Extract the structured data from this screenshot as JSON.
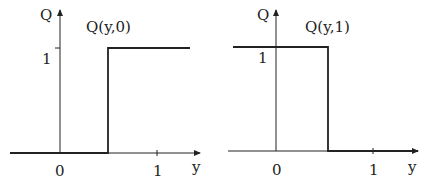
{
  "panels": [
    {
      "id": "left",
      "axis_y_label": "Q",
      "axis_x_label": "y",
      "function_label": "Q(y,0)",
      "tick_x0": "0",
      "tick_x1": "1",
      "tick_y1": "1",
      "description": "Step function: 0 for y < 0.5, 1 for y > 0.5"
    },
    {
      "id": "right",
      "axis_y_label": "Q",
      "axis_x_label": "y",
      "function_label": "Q(y,1)",
      "tick_x0": "0",
      "tick_x1": "1",
      "tick_y1": "1",
      "description": "Step function: 1 for y < 0.5, 0 for y > 0.5"
    }
  ]
}
